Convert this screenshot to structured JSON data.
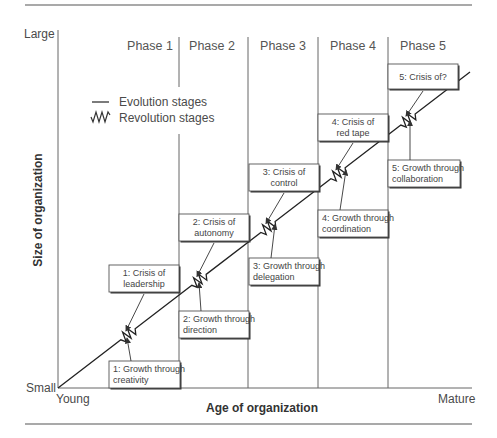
{
  "axes": {
    "y_title": "Size of organization",
    "x_title": "Age of organization",
    "y_top": "Large",
    "y_bottom": "Small",
    "x_left": "Young",
    "x_right": "Mature"
  },
  "phases": [
    "Phase 1",
    "Phase 2",
    "Phase 3",
    "Phase 4",
    "Phase 5"
  ],
  "legend": {
    "evolution": "Evolution stages",
    "revolution": "Revolution stages"
  },
  "growth_boxes": [
    {
      "line1": "1: Growth through",
      "line2": "creativity"
    },
    {
      "line1": "2: Growth through",
      "line2": "direction"
    },
    {
      "line1": "3: Growth through",
      "line2": "delegation"
    },
    {
      "line1": "4: Growth through",
      "line2": "coordination"
    },
    {
      "line1": "5: Growth through",
      "line2": "collaboration"
    }
  ],
  "crisis_boxes": [
    {
      "line1": "1: Crisis of",
      "line2": "leadership"
    },
    {
      "line1": "2: Crisis of",
      "line2": "autonomy"
    },
    {
      "line1": "3: Crisis of",
      "line2": "control"
    },
    {
      "line1": "4: Crisis of",
      "line2": "red tape"
    },
    {
      "line1": "5: Crisis of?",
      "line2": ""
    }
  ]
}
